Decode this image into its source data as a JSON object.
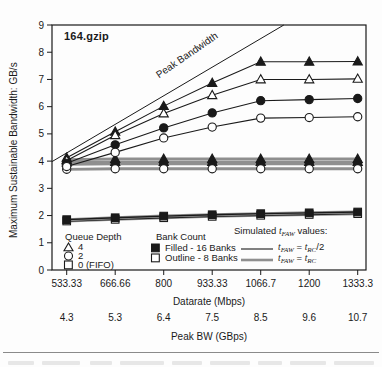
{
  "figure": {
    "title": "164.gzip",
    "peak_line_label": "Peak Bandwidth"
  },
  "axes": {
    "y_label": "Maximum Sustainable Bandwidth: GB/s",
    "x_label": "Datarate (Mbps)",
    "x2_label": "Peak BW (GBps)"
  },
  "legend": {
    "queue_depth": {
      "header": "Queue Depth",
      "items": [
        {
          "marker": "open-triangle",
          "label": "4"
        },
        {
          "marker": "open-circle",
          "label": "2"
        },
        {
          "marker": "open-square",
          "label": "0 (FIFO)"
        }
      ]
    },
    "bank_count": {
      "header": "Bank Count",
      "items": [
        {
          "marker": "filled-square",
          "label": "Filled - 16 Banks"
        },
        {
          "marker": "open-square",
          "label": "Outline - 8 Banks"
        }
      ]
    },
    "tfaw": {
      "header_pre": "Simulated ",
      "header_t": "t",
      "header_sub": "FAW",
      "header_post": " values:",
      "rows": [
        {
          "t1": "t",
          "s1": "FAW",
          "eq": " = ",
          "t2": "t",
          "s2": "RC",
          "post": "/2",
          "style": "thin-black"
        },
        {
          "t1": "t",
          "s1": "FAW",
          "eq": " = ",
          "t2": "t",
          "s2": "RC",
          "post": "",
          "style": "thick-gray"
        }
      ]
    }
  },
  "chart_data": {
    "type": "line",
    "title": "164.gzip",
    "xlabel": "Datarate (Mbps)",
    "x2label": "Peak BW (GBps)",
    "ylabel": "Maximum Sustainable Bandwidth: GB/s",
    "ylim": [
      0,
      9
    ],
    "yticks": [
      0,
      1,
      2,
      3,
      4,
      5,
      6,
      7,
      8,
      9
    ],
    "x": [
      533.33,
      666.66,
      800,
      933.33,
      1066.7,
      1200,
      1333.3
    ],
    "x_ticklabels": [
      "533.33",
      "666.66",
      "800",
      "933.33",
      "1066.7",
      "1200",
      "1333.3"
    ],
    "x2_ticklabels": [
      "4.3",
      "5.3",
      "6.4",
      "7.5",
      "8.5",
      "9.6",
      "10.7"
    ],
    "grid": false,
    "colors": {
      "line": "#1a1a1a",
      "trc_gray": "#8f8f8f"
    },
    "peak_line": {
      "label": "Peak Bandwidth",
      "anchor_points": [
        [
          533.33,
          4.3
        ],
        [
          1066.7,
          8.5
        ]
      ]
    },
    "series": [
      {
        "id": "qd4-8banks-tRC",
        "queue_depth": 4,
        "banks": 8,
        "tfaw": "tRC",
        "marker": "open-triangle",
        "line": "thick-gray",
        "values": [
          3.95,
          3.97,
          3.97,
          3.97,
          3.97,
          3.97,
          3.97
        ]
      },
      {
        "id": "qd2-16banks-tRC",
        "queue_depth": 2,
        "banks": 16,
        "tfaw": "tRC",
        "marker": "filled-circle",
        "line": "thick-gray",
        "values": [
          3.88,
          3.9,
          3.9,
          3.9,
          3.9,
          3.9,
          3.9
        ]
      },
      {
        "id": "qd4-16banks-tRC",
        "queue_depth": 4,
        "banks": 16,
        "tfaw": "tRC",
        "marker": "filled-triangle",
        "line": "thick-gray",
        "values": [
          4.05,
          4.08,
          4.08,
          4.08,
          4.08,
          4.08,
          4.08
        ]
      },
      {
        "id": "qd2-8banks-tRC",
        "queue_depth": 2,
        "banks": 8,
        "tfaw": "tRC",
        "marker": "open-circle",
        "line": "thick-gray",
        "values": [
          3.7,
          3.72,
          3.72,
          3.72,
          3.72,
          3.72,
          3.72
        ]
      },
      {
        "id": "qd4-16banks-tRChalf",
        "queue_depth": 4,
        "banks": 16,
        "tfaw": "tRC/2",
        "marker": "filled-triangle",
        "line": "thin-black",
        "values": [
          4.12,
          5.08,
          6.02,
          6.87,
          7.65,
          7.65,
          7.66
        ]
      },
      {
        "id": "qd4-8banks-tRChalf",
        "queue_depth": 4,
        "banks": 8,
        "tfaw": "tRC/2",
        "marker": "open-triangle",
        "line": "thin-black",
        "values": [
          4.02,
          4.95,
          5.75,
          6.42,
          7.0,
          7.0,
          7.02
        ]
      },
      {
        "id": "qd2-16banks-tRChalf",
        "queue_depth": 2,
        "banks": 16,
        "tfaw": "tRC/2",
        "marker": "filled-circle",
        "line": "thin-black",
        "values": [
          3.92,
          4.6,
          5.22,
          5.77,
          6.22,
          6.26,
          6.3
        ]
      },
      {
        "id": "qd2-8banks-tRChalf",
        "queue_depth": 2,
        "banks": 8,
        "tfaw": "tRC/2",
        "marker": "open-circle",
        "line": "thin-black",
        "values": [
          3.8,
          4.32,
          4.85,
          5.25,
          5.58,
          5.6,
          5.63
        ]
      },
      {
        "id": "qd0-8banks",
        "queue_depth": 0,
        "banks": 8,
        "tfaw": "both",
        "marker": "open-square",
        "line": "combo",
        "values": [
          1.8,
          1.86,
          1.92,
          1.97,
          2.01,
          2.04,
          2.07
        ]
      },
      {
        "id": "qd0-16banks",
        "queue_depth": 0,
        "banks": 16,
        "tfaw": "both",
        "marker": "filled-square",
        "line": "combo",
        "values": [
          1.85,
          1.92,
          1.98,
          2.03,
          2.07,
          2.1,
          2.13
        ]
      }
    ]
  }
}
